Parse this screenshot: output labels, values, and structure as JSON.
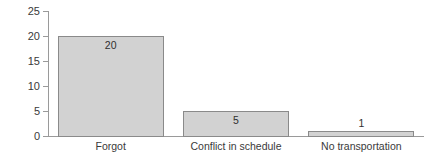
{
  "chart_data": {
    "type": "bar",
    "title": "",
    "xlabel": "",
    "ylabel": "Missed visits",
    "categories": [
      "Forgot",
      "Conflict in schedule",
      "No transportation"
    ],
    "values": [
      20,
      5,
      1
    ],
    "value_labels": [
      "20",
      "5",
      "1"
    ],
    "ylim": [
      0,
      25
    ],
    "yticks": [
      0,
      5,
      10,
      15,
      20,
      25
    ],
    "ytick_labels": [
      "0",
      "5",
      "10",
      "15",
      "20",
      "25"
    ],
    "grid": false,
    "legend": false,
    "legend_position": "none",
    "bar_fill_color": "#d2d2d2",
    "bar_border_color": "#8a8a8a",
    "axis_color": "#9a9a9a",
    "text_color": "#3a3a3a",
    "background_color": "#ffffff"
  }
}
